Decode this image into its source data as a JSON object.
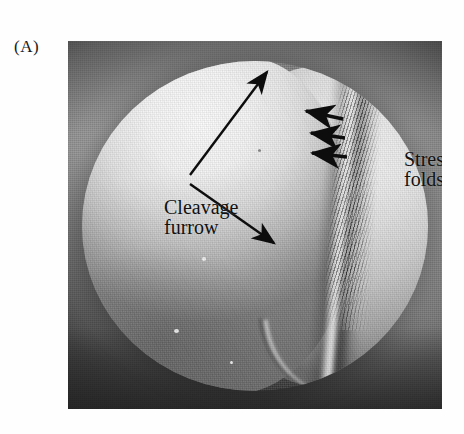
{
  "figure": {
    "panel_label": "(A)",
    "type": "scanning-electron-micrograph"
  },
  "annotations": [
    {
      "id": "cleavage-furrow",
      "line1": "Cleavage",
      "line2": "furrow",
      "pointer": "double-leader-v",
      "arrow_count": 2
    },
    {
      "id": "stress-folds",
      "line1": "Stress",
      "line2": "folds",
      "pointer": "triple-arrow-left",
      "arrow_count": 3
    }
  ],
  "colors": {
    "plate_background": "#9a9a9a",
    "plate_dark_corner": "#3a3a3a",
    "cell_highlight": "#f0f0f0",
    "cell_midtone": "#8a8a8a",
    "annotation_ink": "#111111",
    "page_background": "#ffffff"
  }
}
